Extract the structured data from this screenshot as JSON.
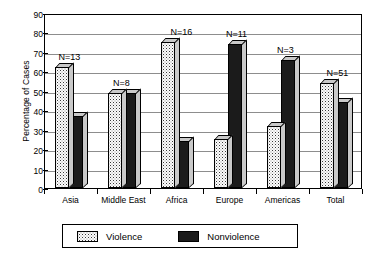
{
  "chart_data": {
    "type": "bar",
    "title": "",
    "xlabel": "",
    "ylabel": "Percentage of Cases",
    "ylim": [
      0,
      90
    ],
    "ytick_step": 10,
    "yticks": [
      "90",
      "80",
      "70",
      "60",
      "50",
      "40",
      "30",
      "20",
      "10",
      "0"
    ],
    "grid": true,
    "legend_position": "bottom",
    "categories": [
      "Asia",
      "Middle East",
      "Africa",
      "Europe",
      "Americas",
      "Total"
    ],
    "annotations": [
      "N=13",
      "N=8",
      "N=16",
      "N=11",
      "N=3",
      "N=51"
    ],
    "series": [
      {
        "name": "Violence",
        "values": [
          62,
          49,
          75,
          25,
          32,
          54
        ]
      },
      {
        "name": "Nonviolence",
        "values": [
          37,
          49,
          24,
          74,
          66,
          44
        ]
      }
    ]
  },
  "legend": {
    "items": [
      {
        "label": "Violence",
        "pattern": "hatched",
        "color": "#3b3b3b"
      },
      {
        "label": "Nonviolence",
        "pattern": "solid",
        "color": "#1b1b1b"
      }
    ]
  }
}
